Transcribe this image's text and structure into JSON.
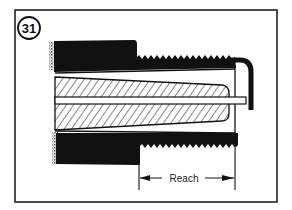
{
  "figure": {
    "number": "31",
    "dimension_label": "Reach",
    "colors": {
      "ink": "#111111",
      "background": "#ffffff",
      "frame": "#222222"
    }
  }
}
